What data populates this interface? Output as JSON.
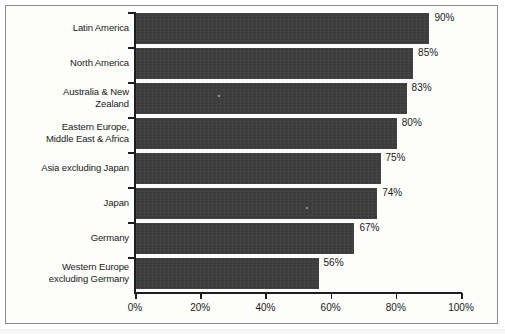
{
  "chart_data": {
    "type": "bar",
    "orientation": "horizontal",
    "title": "",
    "xlabel": "",
    "ylabel": "",
    "xlim": [
      0,
      100
    ],
    "xticks": [
      "0%",
      "20%",
      "40%",
      "60%",
      "80%",
      "100%"
    ],
    "xtick_values": [
      0,
      20,
      40,
      60,
      80,
      100
    ],
    "grid": false,
    "legend": null,
    "bar_color": "#3b3b3b",
    "axis_color": "#1d1d1d",
    "categories": [
      "Latin America",
      "North America",
      "Australia & New\nZealand",
      "Eastern Europe,\nMiddle East & Africa",
      "Asia excluding Japan",
      "Japan",
      "Germany",
      "Western Europe\nexcluding Germany"
    ],
    "values": [
      90,
      85,
      83,
      80,
      75,
      74,
      67,
      56
    ],
    "value_labels": [
      "90%",
      "85%",
      "83%",
      "80%",
      "75%",
      "74%",
      "67%",
      "56%"
    ]
  }
}
